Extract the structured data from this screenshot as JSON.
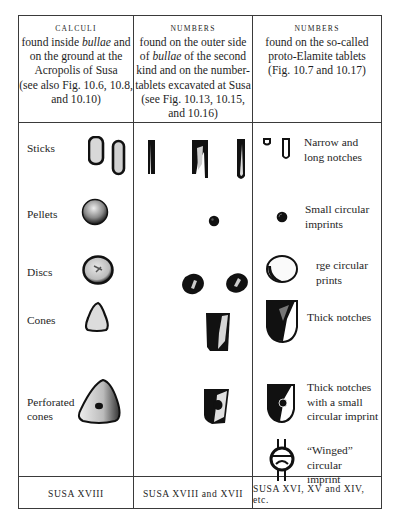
{
  "columns": [
    {
      "caption": "CALCULI",
      "line1_pre": "found inside ",
      "line1_em": "bullae",
      "line1_post": " and",
      "rest": [
        "on the ground at the",
        "Acropolis of Susa",
        "(see also Fig. 10.6, 10.8,",
        "and 10.10)"
      ],
      "footer": "SUSA XVIII"
    },
    {
      "caption": "NUMBERS",
      "line1_pre": "found on the outer side",
      "line2_pre": "of ",
      "line2_em": "bullae",
      "line2_post": " of the second",
      "rest": [
        "kind and on the number-",
        "tablets excavated at Susa",
        "(see Fig. 10.13, 10.15,",
        "and 10.16)"
      ],
      "footer": "SUSA XVIII and XVII"
    },
    {
      "caption": "NUMBERS",
      "rest": [
        "found on the so-called",
        "proto-Elamite tablets",
        "(Fig. 10.7 and 10.17)"
      ],
      "footer": "SUSA XVI, XV and XIV, etc."
    }
  ],
  "rows": [
    {
      "label": "Sticks",
      "note": [
        "Narrow and",
        "long notches"
      ]
    },
    {
      "label": "Pellets",
      "note": [
        "Small circular",
        "imprints"
      ]
    },
    {
      "label": "Discs",
      "note": [
        "rge circular",
        "prints"
      ]
    },
    {
      "label": "Cones",
      "note": [
        "Thick notches"
      ]
    },
    {
      "label_lines": [
        "Perforated",
        "cones"
      ],
      "note": [
        "Thick notches",
        "with a small",
        "circular imprint"
      ]
    },
    {
      "note": [
        "“Winged” circular",
        "imprint"
      ]
    }
  ],
  "colors": {
    "ink": "#1e1e1e",
    "rule": "#3a3a3a",
    "paper": "#ffffff"
  }
}
